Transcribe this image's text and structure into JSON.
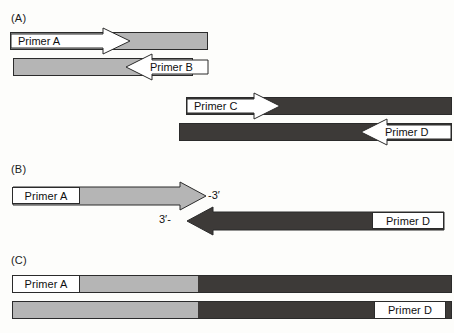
{
  "figure": {
    "background_color": "#fdfdfb"
  },
  "colors": {
    "light_strand": "#b5b5b5",
    "dark_strand": "#3d3a38",
    "outline": "#2b2b2b",
    "label_box_fill": "#ffffff",
    "text": "#101010"
  },
  "panels": [
    {
      "id": "A",
      "label": "(A)",
      "description": "Two separate templates: light-gray duplex with Primer A and Primer B; dark-gray duplex with Primer C and Primer D",
      "primers": [
        {
          "name": "Primer A",
          "strand": "light",
          "direction": "right"
        },
        {
          "name": "Primer B",
          "strand": "light",
          "direction": "left"
        },
        {
          "name": "Primer C",
          "strand": "dark",
          "direction": "right"
        },
        {
          "name": "Primer D",
          "strand": "dark",
          "direction": "left"
        }
      ]
    },
    {
      "id": "B",
      "label": "(B)",
      "description": "Primer A extends rightward on the light strand, Primer D extends leftward on the dark strand; the two 3' ends meet",
      "primers": [
        {
          "name": "Primer A",
          "strand": "light",
          "direction": "right"
        },
        {
          "name": "Primer D",
          "strand": "dark",
          "direction": "left"
        }
      ],
      "end_labels": [
        {
          "text": "-3′",
          "position": "right-of-light-arrow-tip"
        },
        {
          "text": "3′-",
          "position": "left-of-dark-arrow-tip"
        }
      ]
    },
    {
      "id": "C",
      "label": "(C)",
      "description": "Fused hybrid product: light-gray segment joined to dark-gray segment on both strands, flanked by Primer A and Primer D",
      "primers": [
        {
          "name": "Primer A",
          "strand": "light",
          "direction": "right"
        },
        {
          "name": "Primer D",
          "strand": "dark",
          "direction": "left"
        }
      ]
    }
  ],
  "labels": {
    "panel_a": "(A)",
    "panel_b": "(B)",
    "panel_c": "(C)",
    "primer_a": "Primer A",
    "primer_b": "Primer B",
    "primer_c": "Primer C",
    "primer_d": "Primer D",
    "three_prime_right": "-3′",
    "three_prime_left": "3′-"
  }
}
